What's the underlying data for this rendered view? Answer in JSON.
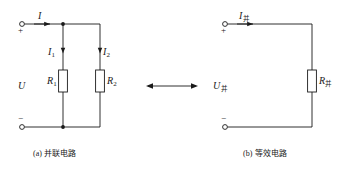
{
  "figure": {
    "type": "circuit-diagram",
    "background_color": "#ffffff",
    "line_color": "#1a1a1a",
    "text_color": "#1a1a1a"
  },
  "left_circuit": {
    "caption_tag": "(a)",
    "caption_text": "并联电路",
    "total_current_label": "I",
    "voltage_label": "U",
    "plus_sign": "+",
    "minus_sign": "−",
    "branch1_current": "I",
    "branch1_current_sub": "1",
    "branch2_current": "I",
    "branch2_current_sub": "2",
    "resistor1_label": "R",
    "resistor1_sub": "1",
    "resistor2_label": "R",
    "resistor2_sub": "2"
  },
  "equivalence_arrow": {
    "glyph": "double-headed-arrow"
  },
  "right_circuit": {
    "caption_tag": "(b)",
    "caption_text": "等效电路",
    "current_label": "I",
    "current_sub": "并",
    "voltage_label": "U",
    "voltage_sub": "并",
    "resistor_label": "R",
    "resistor_sub": "并",
    "plus_sign": "+",
    "minus_sign": "−"
  }
}
